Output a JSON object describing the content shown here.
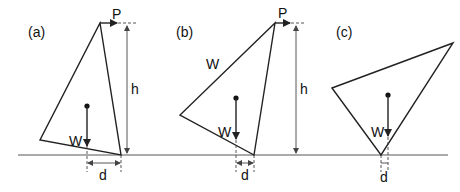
{
  "panels": [
    {
      "id": "a",
      "label": "(a)",
      "force_label": "P",
      "height_label": "h",
      "weight_label": "W",
      "distance_label": "d"
    },
    {
      "id": "b",
      "label": "(b)",
      "force_label": "P",
      "height_label": "h",
      "weight_label": "W",
      "distance_label": "d",
      "extra_label": "W"
    },
    {
      "id": "c",
      "label": "(c)",
      "weight_label": "W",
      "distance_label": "d"
    }
  ],
  "colors": {
    "line": "#222222",
    "background": "#ffffff"
  }
}
